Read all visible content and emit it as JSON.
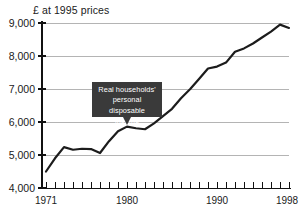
{
  "chart_data": {
    "type": "line",
    "title": "",
    "ylabel": "£ at 1995 prices",
    "xlabel": "",
    "ylim": [
      4000,
      9000
    ],
    "xlim": [
      1971,
      1998
    ],
    "grid": true,
    "legend_position": "none",
    "y_ticks": [
      "9,000",
      "8,000",
      "7,000",
      "6,000",
      "5,000",
      "4,000"
    ],
    "y_tick_values": [
      9000,
      8000,
      7000,
      6000,
      5000,
      4000
    ],
    "x_ticks": [
      "1971",
      "1980",
      "1990",
      "1998"
    ],
    "x_tick_values": [
      1971,
      1980,
      1990,
      1998
    ],
    "annotations": [
      {
        "text_line1": "Real households'",
        "text_line2": "personal disposable",
        "text_line3": "income",
        "points_to_year": 1980,
        "points_to_value": 5850
      }
    ],
    "series": [
      {
        "name": "Real households' personal disposable income",
        "x": [
          1971,
          1972,
          1973,
          1974,
          1975,
          1976,
          1977,
          1978,
          1979,
          1980,
          1981,
          1982,
          1983,
          1984,
          1985,
          1986,
          1987,
          1988,
          1989,
          1990,
          1991,
          1992,
          1993,
          1994,
          1995,
          1996,
          1997,
          1998
        ],
        "values": [
          4500,
          4900,
          5240,
          5160,
          5190,
          5180,
          5060,
          5420,
          5720,
          5860,
          5810,
          5780,
          5960,
          6180,
          6400,
          6720,
          6990,
          7300,
          7620,
          7680,
          7800,
          8130,
          8230,
          8380,
          8560,
          8740,
          8950,
          8850
        ]
      }
    ]
  },
  "axis_title": "£ at 1995 prices"
}
